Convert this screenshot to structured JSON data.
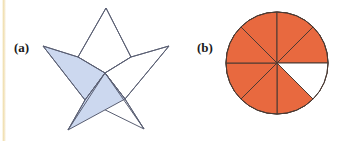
{
  "figure": {
    "width": 341,
    "height": 141,
    "background": "#ffffff",
    "scan_edge_color": "#f0dfae"
  },
  "panels": [
    {
      "id": "a",
      "label": "(a)",
      "label_x": 14,
      "label_y": 40,
      "shape": "five-pointed-star-of-rhombi",
      "description": "Five-pointed star composed of five rhombi meeting at the center; two adjacent rhombi are shaded light blue",
      "stroke_color": "#5a5f73",
      "stroke_width": 1,
      "fill_unshaded": "#ffffff",
      "fill_shaded": "#ccd8ef",
      "center": {
        "x": 105,
        "y": 73
      },
      "points": [
        {
          "name": "top",
          "x": 106,
          "y": 8
        },
        {
          "name": "right",
          "x": 169,
          "y": 46
        },
        {
          "name": "bottom-right",
          "x": 144,
          "y": 129
        },
        {
          "name": "bottom-left",
          "x": 68,
          "y": 130
        },
        {
          "name": "left",
          "x": 43,
          "y": 46
        }
      ],
      "inner_points": [
        {
          "name": "upper-right",
          "x": 131,
          "y": 57
        },
        {
          "name": "lower-right",
          "x": 125,
          "y": 99
        },
        {
          "name": "lower-left",
          "x": 85,
          "y": 100
        },
        {
          "name": "upper-left",
          "x": 78,
          "y": 57
        },
        {
          "name": "upper-center",
          "x": 105,
          "y": 32
        }
      ],
      "rhombi": [
        {
          "name": "top-rhombus",
          "shaded": false,
          "tip": "top"
        },
        {
          "name": "right-rhombus",
          "shaded": false,
          "tip": "right"
        },
        {
          "name": "bottom-right-rhombus",
          "shaded": false,
          "tip": "bottom-right"
        },
        {
          "name": "bottom-left-rhombus",
          "shaded": true,
          "tip": "bottom-left"
        },
        {
          "name": "left-rhombus",
          "shaded": true,
          "tip": "left"
        }
      ],
      "shaded_count": 2,
      "total_count": 5,
      "fraction": "2/5"
    },
    {
      "id": "b",
      "label": "(b)",
      "label_x": 197,
      "label_y": 40,
      "shape": "circle-eight-sectors",
      "description": "Circle divided into eight equal sectors; seven are filled orange and one is white",
      "stroke_color": "#4a3a33",
      "stroke_width": 1,
      "fill_shaded": "#e8693f",
      "fill_unshaded": "#ffffff",
      "center": {
        "x": 277,
        "y": 63
      },
      "radius": 51,
      "sector_count": 8,
      "sector_angle_deg": 45,
      "shaded_count": 7,
      "fraction": "7/8",
      "white_sector_start_deg": 0,
      "white_sector_end_deg": 45
    }
  ]
}
